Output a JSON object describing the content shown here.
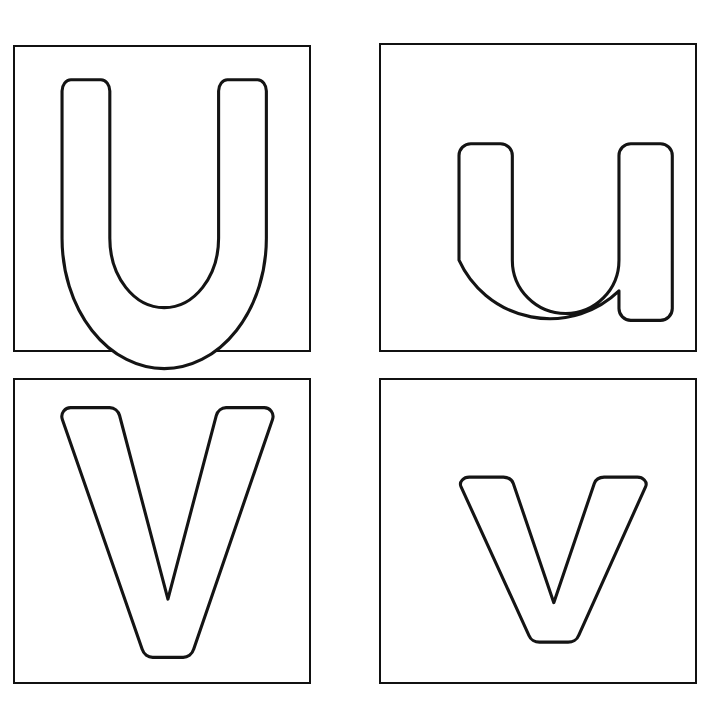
{
  "page": {
    "title": "Letter Tracing Worksheet U V",
    "background_color": "#ffffff",
    "outline_color": "#141414",
    "fill_color": "#ffffff",
    "border_color": "#111111",
    "columns": 2,
    "rows": 2
  },
  "cards": [
    {
      "id": "upper-u",
      "letter": "U",
      "case": "uppercase",
      "letter_name": "capital-letter-u",
      "position": "top-left",
      "row": 1,
      "column": 1
    },
    {
      "id": "lower-u",
      "letter": "u",
      "case": "lowercase",
      "letter_name": "small-letter-u",
      "position": "top-right",
      "row": 1,
      "column": 2
    },
    {
      "id": "upper-v",
      "letter": "V",
      "case": "uppercase",
      "letter_name": "capital-letter-v",
      "position": "bottom-left",
      "row": 2,
      "column": 1
    },
    {
      "id": "lower-v",
      "letter": "v",
      "case": "lowercase",
      "letter_name": "small-letter-v",
      "position": "bottom-right",
      "row": 2,
      "column": 2
    }
  ]
}
